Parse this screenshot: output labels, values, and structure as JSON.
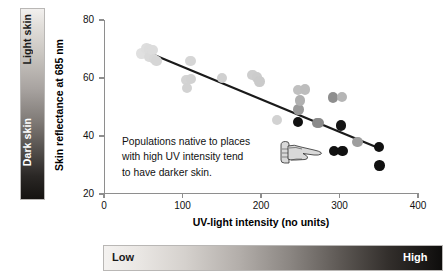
{
  "figure": {
    "left_bar": {
      "top_label": "Light skin",
      "bottom_label": "Dark skin",
      "gradient_from": "#f2f0ee",
      "gradient_to": "#151311"
    },
    "bottom_bar": {
      "left_label": "Low",
      "right_label": "High",
      "gradient_from": "#f4f2f0",
      "gradient_to": "#0e0d0c"
    },
    "annotation": {
      "line1": "Populations native to places",
      "line2": "with high UV intensity tend",
      "line3": "to have darker skin.",
      "pointer_icon": "pointing-hand-icon"
    }
  },
  "chart_data": {
    "type": "scatter",
    "title": "",
    "xlabel": "UV-light intensity (no units)",
    "ylabel": "Skin reflectance at 685 nm",
    "xlim": [
      0,
      400
    ],
    "ylim": [
      20,
      80
    ],
    "xticks": [
      0,
      100,
      200,
      300,
      400
    ],
    "yticks": [
      20,
      40,
      60,
      80
    ],
    "grid": false,
    "legend": false,
    "points": [
      {
        "x": 48,
        "y": 68.5,
        "color": "#e0e0e0"
      },
      {
        "x": 54,
        "y": 70.2,
        "color": "#dedede"
      },
      {
        "x": 57,
        "y": 69.8,
        "color": "#dcdcdc"
      },
      {
        "x": 58,
        "y": 67.3,
        "color": "#dadada"
      },
      {
        "x": 62,
        "y": 69.6,
        "color": "#dcdcdc"
      },
      {
        "x": 64,
        "y": 66.6,
        "color": "#d8d8d8"
      },
      {
        "x": 67,
        "y": 65.8,
        "color": "#d6d6d6"
      },
      {
        "x": 105,
        "y": 59.4,
        "color": "#d4d4d4"
      },
      {
        "x": 106,
        "y": 56.6,
        "color": "#d2d2d2"
      },
      {
        "x": 110,
        "y": 65.8,
        "color": "#d6d6d6"
      },
      {
        "x": 111,
        "y": 59.6,
        "color": "#d2d2d2"
      },
      {
        "x": 150,
        "y": 59.9,
        "color": "#d0d0d0"
      },
      {
        "x": 189,
        "y": 61.1,
        "color": "#cecece"
      },
      {
        "x": 195,
        "y": 60.2,
        "color": "#cccccc"
      },
      {
        "x": 198,
        "y": 58.8,
        "color": "#cacaca"
      },
      {
        "x": 220,
        "y": 45.6,
        "color": "#d2d2d2"
      },
      {
        "x": 247,
        "y": 55.8,
        "color": "#c0c0c0"
      },
      {
        "x": 248,
        "y": 49.2,
        "color": "#9a9a9a"
      },
      {
        "x": 250,
        "y": 52.2,
        "color": "#b0b0b0"
      },
      {
        "x": 247,
        "y": 44.8,
        "color": "#111111"
      },
      {
        "x": 256,
        "y": 56.0,
        "color": "#bdbdbd"
      },
      {
        "x": 271,
        "y": 44.4,
        "color": "#8a8a8a"
      },
      {
        "x": 274,
        "y": 44.4,
        "color": "#8a8a8a"
      },
      {
        "x": 292,
        "y": 53.3,
        "color": "#8e8e8e"
      },
      {
        "x": 293,
        "y": 34.9,
        "color": "#111111"
      },
      {
        "x": 302,
        "y": 43.6,
        "color": "#151515"
      },
      {
        "x": 303,
        "y": 53.4,
        "color": "#b5b5b5"
      },
      {
        "x": 304,
        "y": 34.9,
        "color": "#111111"
      },
      {
        "x": 323,
        "y": 37.9,
        "color": "#9e9e9e"
      },
      {
        "x": 350,
        "y": 36.2,
        "color": "#111111"
      },
      {
        "x": 351,
        "y": 29.8,
        "color": "#111111"
      }
    ],
    "trendline": {
      "x1": 47,
      "y1": 69.8,
      "x2": 352,
      "y2": 35.6,
      "color": "#1a1a1a",
      "width": 2.2
    }
  }
}
